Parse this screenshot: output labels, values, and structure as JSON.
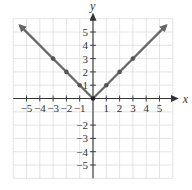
{
  "chart_data": {
    "type": "line",
    "title": "",
    "function": "y = |x|",
    "xlabel": "x",
    "ylabel": "y",
    "xlim": [
      -6,
      6
    ],
    "ylim": [
      -6,
      6
    ],
    "grid": true,
    "x_ticks": [
      -5,
      -4,
      -3,
      -2,
      -1,
      1,
      2,
      3,
      4,
      5
    ],
    "y_ticks": [
      -5,
      -4,
      -3,
      -2,
      1,
      2,
      3,
      4,
      5
    ],
    "x_tick_labels": [
      "−5",
      "−4",
      "−3",
      "−2",
      "−1",
      "1",
      "2",
      "3",
      "4",
      "5"
    ],
    "y_tick_labels": [
      "−5",
      "−4",
      "−3",
      "−2",
      "1",
      "2",
      "3",
      "4",
      "5"
    ],
    "series": [
      {
        "name": "y = |x|",
        "line_endpoints": [
          [
            -5.5,
            5.5
          ],
          [
            0,
            0
          ],
          [
            5.5,
            5.5
          ]
        ],
        "arrows_at_ends": true,
        "points": [
          [
            -3,
            3
          ],
          [
            -2,
            2
          ],
          [
            -1,
            1
          ],
          [
            0,
            0
          ],
          [
            1,
            1
          ],
          [
            2,
            2
          ],
          [
            3,
            3
          ]
        ]
      }
    ],
    "colors": {
      "line": "#666666",
      "grid": "#dddddd",
      "axis": "#333333"
    }
  }
}
